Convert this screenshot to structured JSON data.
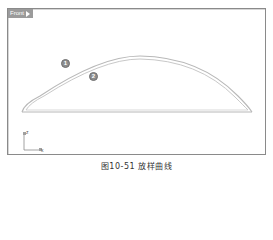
{
  "viewport": {
    "tab_label": "Front",
    "tab_menu_icon": "triangle-right-icon"
  },
  "callouts": [
    {
      "label": "1",
      "x": 61,
      "y": 59
    },
    {
      "label": "2",
      "x": 89,
      "y": 72
    }
  ],
  "axis_widget": {
    "vertical_label": "z",
    "horizontal_label": "x"
  },
  "curves": {
    "description": "Two nested arched loft curves sharing a common baseline",
    "color": "#b5b5b5",
    "left_x": 22,
    "right_x": 252,
    "base_y": 112,
    "peak_y": 56
  },
  "caption": "图10-51  放样曲线"
}
